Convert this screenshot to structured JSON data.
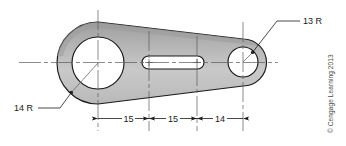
{
  "figure": {
    "kind": "engineering-drawing"
  },
  "callouts": [
    {
      "id": "radius-right",
      "label": "13 R"
    },
    {
      "id": "radius-left",
      "label": "14 R"
    }
  ],
  "dimensions": [
    {
      "id": "dim-1",
      "label": "15"
    },
    {
      "id": "dim-2",
      "label": "15"
    },
    {
      "id": "dim-3",
      "label": "14"
    }
  ],
  "credit": {
    "text": "© Cengage Learning 2013"
  },
  "colors": {
    "outline": "#1a1a1a",
    "body_fill_light": "#d7d7d7",
    "body_fill_dark": "#9e9e9e",
    "hole_fill": "#ffffff",
    "centerline": "#5a5a5a",
    "dimension_line": "#1a1a1a",
    "text": "#1a1a1a",
    "credit_text": "#4a4a4a",
    "background": "#ffffff"
  }
}
